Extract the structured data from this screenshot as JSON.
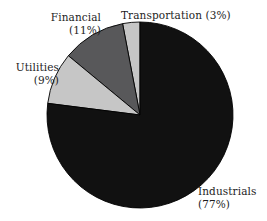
{
  "figure": {
    "background_color": "#ffffff",
    "width": 267,
    "height": 221
  },
  "chart_data": {
    "type": "pie",
    "title": "",
    "xlabel": "",
    "ylabel": "",
    "legend_position": "none",
    "grid": false,
    "start_angle_deg": 90,
    "direction": "counterclockwise",
    "center": {
      "x": 140,
      "y": 115
    },
    "radius": 93,
    "categories": [
      "Transportation",
      "Financial",
      "Utilities",
      "Industrials"
    ],
    "values": [
      3,
      11,
      9,
      77
    ],
    "unit": "%",
    "colors": [
      "#c6c6c6",
      "#58585a",
      "#c6c6c6",
      "#111111"
    ],
    "edge_color": "#000000",
    "slices": [
      {
        "name": "Transportation",
        "value": 3,
        "label": "Transportation (3%)",
        "label_lines": [
          "Transportation (3%)"
        ],
        "color": "#c6c6c6"
      },
      {
        "name": "Financial",
        "value": 11,
        "label": "Financial (11%)",
        "label_lines": [
          "Financial",
          "(11%)"
        ],
        "color": "#58585a"
      },
      {
        "name": "Utilities",
        "value": 9,
        "label": "Utilities (9%)",
        "label_lines": [
          "Utilities",
          "(9%)"
        ],
        "color": "#c6c6c6"
      },
      {
        "name": "Industrials",
        "value": 77,
        "label": "Industrials (77%)",
        "label_lines": [
          "Industrials",
          "(77%)"
        ],
        "color": "#111111"
      }
    ]
  },
  "labels": {
    "transportation": {
      "line1": "Transportation (3%)"
    },
    "financial": {
      "line1": "Financial",
      "line2": "(11%)"
    },
    "utilities": {
      "line1": "Utilities",
      "line2": "(9%)"
    },
    "industrials": {
      "line1": "Industrials",
      "line2": "(77%)"
    }
  }
}
